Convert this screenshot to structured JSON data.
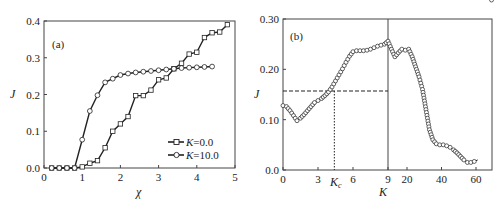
{
  "chart_data": [
    {
      "type": "line",
      "panel_label": "(a)",
      "xlabel": "χ",
      "ylabel": "J",
      "xlim": [
        0,
        5
      ],
      "ylim": [
        0.0,
        0.4
      ],
      "x_ticks": [
        "0",
        "1",
        "2",
        "3",
        "4",
        "5"
      ],
      "y_ticks": [
        "0.0",
        "0.1",
        "0.2",
        "0.3",
        "0.4"
      ],
      "grid": false,
      "legend_position": "lower right",
      "series": [
        {
          "name": "K=0.0",
          "marker": "square",
          "x": [
            0.2,
            0.4,
            0.6,
            0.8,
            1.0,
            1.2,
            1.4,
            1.6,
            1.8,
            2.0,
            2.2,
            2.4,
            2.6,
            2.8,
            3.0,
            3.2,
            3.4,
            3.6,
            3.8,
            4.0,
            4.2,
            4.4,
            4.6,
            4.8
          ],
          "values": [
            0,
            0,
            0,
            0,
            0.003,
            0.013,
            0.02,
            0.055,
            0.1,
            0.12,
            0.14,
            0.197,
            0.197,
            0.212,
            0.24,
            0.245,
            0.27,
            0.285,
            0.31,
            0.315,
            0.355,
            0.368,
            0.37,
            0.39
          ]
        },
        {
          "name": "K=10.0",
          "marker": "circle",
          "x": [
            0.2,
            0.4,
            0.6,
            0.8,
            1.0,
            1.2,
            1.4,
            1.6,
            1.8,
            2.0,
            2.2,
            2.4,
            2.6,
            2.8,
            3.0,
            3.2,
            3.4,
            3.6,
            3.8,
            4.0,
            4.2,
            4.4
          ],
          "values": [
            0,
            0,
            0,
            0,
            0.077,
            0.155,
            0.198,
            0.233,
            0.243,
            0.253,
            0.257,
            0.26,
            0.262,
            0.264,
            0.266,
            0.268,
            0.27,
            0.272,
            0.273,
            0.274,
            0.275,
            0.276
          ]
        }
      ],
      "legend": [
        {
          "label_var": "K",
          "label_val": "=0.0"
        },
        {
          "label_var": "K",
          "label_val": "=10.0"
        }
      ]
    },
    {
      "type": "line",
      "panel_label": "(b)",
      "xlabel": "K",
      "ylabel": "J",
      "ylim": [
        0.0,
        0.3
      ],
      "x_ticks": [
        "0",
        "3",
        "6",
        "9",
        "20",
        "40",
        "60"
      ],
      "y_ticks": [
        "0.0",
        "0.10",
        "0.20",
        "0.30"
      ],
      "grid": false,
      "broken_axis_at": 9,
      "annotations": {
        "critical_label": "K",
        "critical_sub": "c",
        "critical_K": 4.4,
        "critical_J": 0.157
      },
      "series": [
        {
          "name": "J vs K",
          "marker": "circle",
          "x": [
            0,
            0.3,
            0.6,
            0.9,
            1.2,
            1.5,
            1.8,
            2.1,
            2.4,
            2.7,
            3.0,
            3.3,
            3.6,
            3.9,
            4.2,
            4.5,
            4.8,
            5.1,
            5.4,
            5.7,
            6.0,
            6.3,
            6.6,
            6.9,
            7.2,
            7.5,
            7.8,
            8.1,
            8.4,
            8.7,
            9.0,
            11,
            13,
            15,
            17,
            19,
            21,
            23,
            25,
            27,
            29,
            31,
            33,
            35,
            37,
            39,
            41,
            43,
            45,
            47,
            49,
            51,
            53,
            55,
            57,
            59,
            61,
            63,
            65,
            67,
            69
          ],
          "values": [
            0.128,
            0.126,
            0.118,
            0.108,
            0.098,
            0.103,
            0.11,
            0.118,
            0.126,
            0.134,
            0.138,
            0.142,
            0.148,
            0.155,
            0.165,
            0.177,
            0.189,
            0.201,
            0.214,
            0.226,
            0.235,
            0.237,
            0.237,
            0.237,
            0.238,
            0.24,
            0.243,
            0.246,
            0.248,
            0.25,
            0.256,
            0.24,
            0.225,
            0.233,
            0.24,
            0.238,
            0.24,
            0.225,
            0.205,
            0.185,
            0.16,
            0.12,
            0.08,
            0.06,
            0.052,
            0.05,
            0.05,
            0.048,
            0.045,
            0.04,
            0.034,
            0.027,
            0.02,
            0.015,
            0.015,
            0.017,
            0.02
          ]
        }
      ]
    }
  ]
}
